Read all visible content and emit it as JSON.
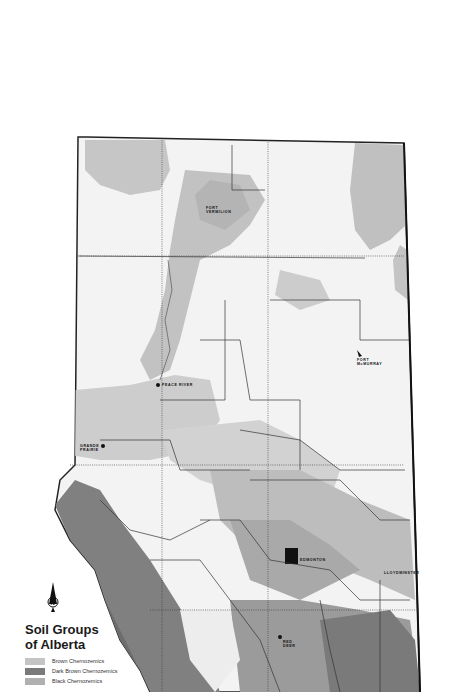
{
  "map": {
    "title_line1": "Soil Groups",
    "title_line2": "of Alberta",
    "north_arrow": "north-arrow-icon",
    "legend": [
      {
        "label": "Brown Chernozemics",
        "color": "#c4c4c4"
      },
      {
        "label": "Dark Brown Chernozemics",
        "color": "#7a7a7a"
      },
      {
        "label": "Black Chernozemics",
        "color": "#b0b0b0"
      }
    ],
    "places": [
      {
        "name_line1": "FORT",
        "name_line2": "VERMILION"
      },
      {
        "name_line1": "FORT",
        "name_line2": "McMURRAY"
      },
      {
        "name_line1": "PEACE RIVER",
        "name_line2": ""
      },
      {
        "name_line1": "GRANDE",
        "name_line2": "PRAIRIE"
      },
      {
        "name_line1": "EDMONTON",
        "name_line2": ""
      },
      {
        "name_line1": "LLOYDMINSTER",
        "name_line2": ""
      },
      {
        "name_line1": "RED",
        "name_line2": "DEER"
      }
    ],
    "colors": {
      "background": "#ffffff",
      "light_fill": "#f2f2f2",
      "gray_fill": "#c8c8c8",
      "mid_fill": "#a8a8a8",
      "dark_fill": "#7d7d7d",
      "border": "#222222"
    }
  }
}
